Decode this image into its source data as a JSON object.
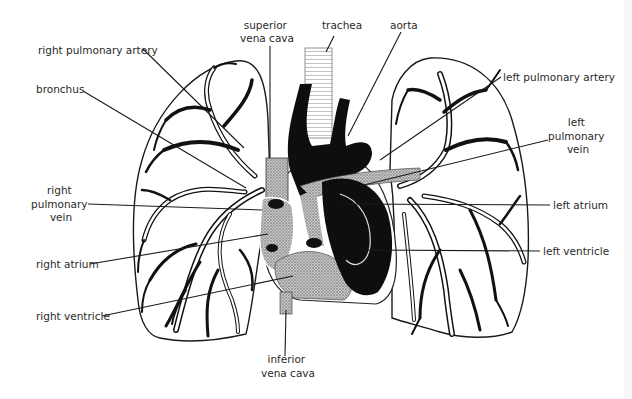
{
  "diagram": {
    "labels": {
      "right_pulmonary_artery": "right pulmonary artery",
      "bronchus": "bronchus",
      "superior_vena_cava": [
        "superior",
        "vena cava"
      ],
      "trachea": "trachea",
      "aorta": "aorta",
      "left_pulmonary_artery": "left  pulmonary artery",
      "left_pulmonary_vein": [
        "left",
        "pulmonary",
        "vein"
      ],
      "right_pulmonary_vein": [
        "right",
        "pulmonary",
        "vein"
      ],
      "left_atrium": "left atrium",
      "right_atrium": "right atrium",
      "left_ventricle": "left ventricle",
      "right_ventricle": "right ventricle",
      "inferior_vena_cava": [
        "inferior",
        "vena cava"
      ]
    }
  }
}
